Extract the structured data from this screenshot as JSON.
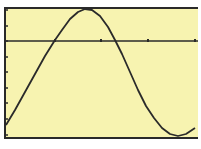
{
  "chart_data": {
    "type": "line",
    "title": "",
    "xlabel": "",
    "ylabel": "",
    "grid": false,
    "legend": null,
    "x_axis": {
      "pixel_y": 41,
      "ticks_px": [
        55,
        101,
        148,
        195
      ]
    },
    "y_axis": {
      "pixel_x": 5,
      "ticks_px": [
        10,
        26,
        41,
        57,
        72,
        88,
        103,
        119,
        135
      ]
    },
    "series": [
      {
        "name": "y1",
        "points_px": [
          [
            6,
            125
          ],
          [
            15,
            110
          ],
          [
            25,
            92
          ],
          [
            35,
            74
          ],
          [
            45,
            56
          ],
          [
            55,
            40
          ],
          [
            62,
            30
          ],
          [
            70,
            19
          ],
          [
            78,
            12
          ],
          [
            85,
            9
          ],
          [
            92,
            10
          ],
          [
            100,
            16
          ],
          [
            108,
            27
          ],
          [
            115,
            40
          ],
          [
            122,
            54
          ],
          [
            130,
            72
          ],
          [
            138,
            90
          ],
          [
            146,
            106
          ],
          [
            154,
            118
          ],
          [
            162,
            128
          ],
          [
            170,
            134
          ],
          [
            178,
            136
          ],
          [
            186,
            134
          ],
          [
            195,
            128
          ]
        ]
      }
    ],
    "colors": {
      "screen_bg": "#f7f3b0",
      "ink": "#2a2a2a"
    }
  }
}
